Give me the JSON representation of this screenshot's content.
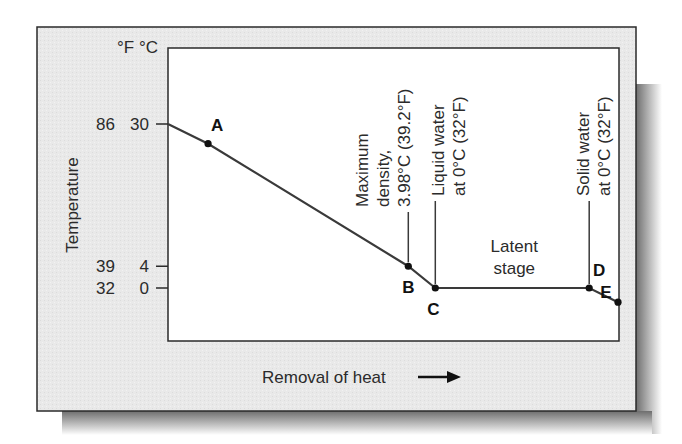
{
  "colors": {
    "frame_fill": "#e8e8e8",
    "frame_border": "#2a2a2a",
    "plot_fill": "#ffffff",
    "line": "#3a3a3a",
    "text": "#2b2b2b",
    "point": "#111111",
    "shadow": "#8a8a8a"
  },
  "chart_data": {
    "type": "line",
    "title": "",
    "xlabel": "Removal of heat",
    "xlabel_arrow": "→",
    "ylabel": "Temperature",
    "unit_header": "°F °C",
    "y_ticks": [
      {
        "f": "86",
        "c": "30",
        "value_c": 30
      },
      {
        "f": "39",
        "c": "4",
        "value_c": 3.98
      },
      {
        "f": "32",
        "c": "0",
        "value_c": 0
      }
    ],
    "ylim_c": [
      -3,
      38
    ],
    "x_range": [
      0,
      100
    ],
    "series": [
      {
        "name": "Cooling curve of water",
        "points": [
          {
            "x": 0,
            "y": 30,
            "label": ""
          },
          {
            "x": 8.9,
            "y": 26.4,
            "label": "A"
          },
          {
            "x": 53.4,
            "y": 3.98,
            "label": "B"
          },
          {
            "x": 59.4,
            "y": 0,
            "label": "C"
          },
          {
            "x": 93.6,
            "y": 0,
            "label": "D"
          },
          {
            "x": 100,
            "y": -2.6,
            "label": "E"
          }
        ]
      }
    ],
    "annotations": [
      {
        "id": "max-density",
        "lines": [
          "Maximum",
          "density,",
          "3.98°C (39.2°F)"
        ],
        "target": "B"
      },
      {
        "id": "liquid-water",
        "lines": [
          "Liquid water",
          "at 0°C (32°F)"
        ],
        "target": "C"
      },
      {
        "id": "solid-water",
        "lines": [
          "Solid water",
          "at 0°C (32°F)"
        ],
        "target": "D"
      },
      {
        "id": "latent-stage",
        "lines": [
          "Latent",
          "stage"
        ],
        "target": "C-D"
      }
    ],
    "grid": false,
    "legend": "none"
  }
}
